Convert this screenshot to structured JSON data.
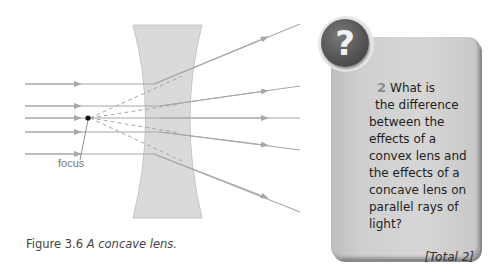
{
  "figure": {
    "label": "focus",
    "caption_number": "Figure 3.6",
    "caption_text": "A concave lens.",
    "lens_type": "concave",
    "colors": {
      "lens_fill": "#dadada",
      "ray": "#a8a8a8",
      "focus_dot": "#111111"
    }
  },
  "question": {
    "icon": "question-mark-icon",
    "icon_glyph": "?",
    "number": "2",
    "lines": [
      "What is",
      "the difference",
      "between the",
      "effects of a",
      "convex lens and",
      "the effects of a",
      "concave lens on",
      "parallel rays of",
      "light?"
    ],
    "total": "[Total 2]"
  }
}
